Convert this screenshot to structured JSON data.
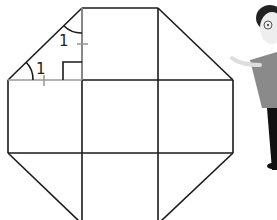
{
  "diagram": {
    "type": "octagon-grid",
    "angle_labels": [
      "1",
      "1"
    ],
    "colors": {
      "stroke": "#1a1a1a",
      "guide": "#999999",
      "shirt": "#8a8a8a",
      "pants": "#111111",
      "skin": "#eeeeee",
      "hair": "#222222"
    }
  }
}
